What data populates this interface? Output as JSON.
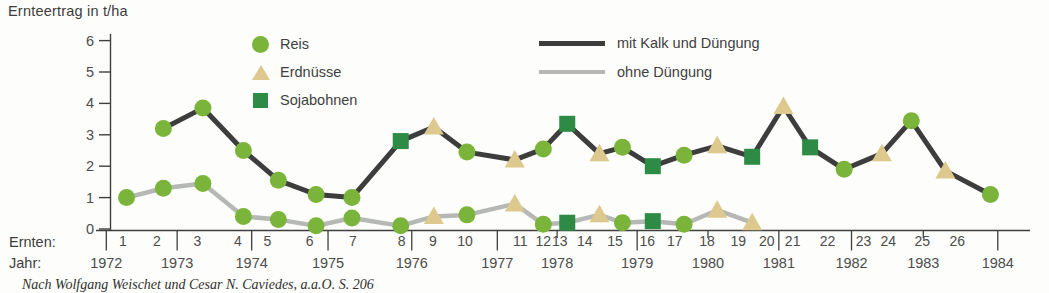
{
  "title": "Ernteertrag in t/ha",
  "legend": {
    "crops": [
      {
        "id": "reis",
        "label": "Reis",
        "shape": "circle",
        "color": "#7ab43a"
      },
      {
        "id": "erdnuesse",
        "label": "Erdnüsse",
        "shape": "triangle",
        "color": "#ddc88d"
      },
      {
        "id": "sojabohnen",
        "label": "Sojabohnen",
        "shape": "square",
        "color": "#2e8b46"
      }
    ],
    "lines": [
      {
        "id": "mit-kalk",
        "label": "mit Kalk und Düngung",
        "color": "#3d3d3d"
      },
      {
        "id": "ohne",
        "label": "ohne Düngung",
        "color": "#b6b8b5"
      }
    ]
  },
  "x_axis": {
    "ernten_caption": "Ernten:",
    "jahr_caption": "Jahr:"
  },
  "footnote": "Nach Wolfgang Weischet und Cesar N. Caviedes, a.a.O. S. 206",
  "chart_data": {
    "type": "line",
    "title": "Ernteertrag in t/ha",
    "ylabel": "Ernteertrag in t/ha",
    "ylim": [
      0,
      6
    ],
    "yticks": [
      0,
      1,
      2,
      3,
      4,
      5,
      6
    ],
    "grid": false,
    "legend_position": "top",
    "harvests": [
      {
        "n": 1,
        "label_x": 0.014,
        "marker_x": 0.018
      },
      {
        "n": 2,
        "label_x": 0.051,
        "marker_x": 0.058
      },
      {
        "n": 3,
        "label_x": 0.095,
        "marker_x": 0.101
      },
      {
        "n": 4,
        "label_x": 0.139,
        "marker_x": 0.145
      },
      {
        "n": 5,
        "label_x": 0.171,
        "marker_x": 0.183
      },
      {
        "n": 6,
        "label_x": 0.217,
        "marker_x": 0.224
      },
      {
        "n": 7,
        "label_x": 0.264,
        "marker_x": 0.263
      },
      {
        "n": 8,
        "label_x": 0.317,
        "marker_x": 0.316
      },
      {
        "n": 9,
        "label_x": 0.351,
        "marker_x": 0.352
      },
      {
        "n": 10,
        "label_x": 0.386,
        "marker_x": 0.388
      },
      {
        "n": 11,
        "label_x": 0.446,
        "marker_x": 0.44
      },
      {
        "n": 12,
        "label_x": 0.471,
        "marker_x": 0.471
      },
      {
        "n": 13,
        "label_x": 0.489,
        "marker_x": 0.497
      },
      {
        "n": 14,
        "label_x": 0.516,
        "marker_x": 0.532
      },
      {
        "n": 15,
        "label_x": 0.549,
        "marker_x": 0.557
      },
      {
        "n": 16,
        "label_x": 0.584,
        "marker_x": 0.59
      },
      {
        "n": 17,
        "label_x": 0.614,
        "marker_x": 0.624
      },
      {
        "n": 18,
        "label_x": 0.649,
        "marker_x": 0.66
      },
      {
        "n": 19,
        "label_x": 0.683,
        "marker_x": 0.698
      },
      {
        "n": 20,
        "label_x": 0.714,
        "marker_x": 0.732
      },
      {
        "n": 21,
        "label_x": 0.742,
        "marker_x": 0.761
      },
      {
        "n": 22,
        "label_x": 0.78,
        "marker_x": 0.798
      },
      {
        "n": 23,
        "label_x": 0.819,
        "marker_x": 0.839
      },
      {
        "n": 24,
        "label_x": 0.846,
        "marker_x": 0.871
      },
      {
        "n": 25,
        "label_x": 0.883,
        "marker_x": 0.908
      },
      {
        "n": 26,
        "label_x": 0.921,
        "marker_x": 0.957
      }
    ],
    "years": [
      {
        "year": 1972,
        "x": -0.004,
        "tick": "long"
      },
      {
        "year": 1973,
        "x": 0.073,
        "tick": "long"
      },
      {
        "year": 1974,
        "x": 0.154,
        "tick": "long"
      },
      {
        "year": 1975,
        "x": 0.237,
        "tick": "long"
      },
      {
        "year": 1976,
        "x": 0.328,
        "tick": "long"
      },
      {
        "year": 1977,
        "x": 0.421,
        "tick": "long"
      },
      {
        "year": 1978,
        "x": 0.486,
        "tick": "short"
      },
      {
        "year": 1979,
        "x": 0.573,
        "tick": "long"
      },
      {
        "year": 1980,
        "x": 0.65,
        "tick": "short"
      },
      {
        "year": 1981,
        "x": 0.727,
        "tick": "long"
      },
      {
        "year": 1982,
        "x": 0.806,
        "tick": "long"
      },
      {
        "year": 1983,
        "x": 0.884,
        "tick": "short"
      },
      {
        "year": 1984,
        "x": 0.965,
        "tick": "long"
      }
    ],
    "series": [
      {
        "name": "mit Kalk und Düngung",
        "color": "#3d3d3d",
        "width": 5,
        "points": [
          {
            "ernte": 2,
            "value": 3.2,
            "crop": "reis"
          },
          {
            "ernte": 3,
            "value": 3.85,
            "crop": "reis"
          },
          {
            "ernte": 4,
            "value": 2.5,
            "crop": "reis"
          },
          {
            "ernte": 5,
            "value": 1.55,
            "crop": "reis"
          },
          {
            "ernte": 6,
            "value": 1.1,
            "crop": "reis"
          },
          {
            "ernte": 7,
            "value": 1.0,
            "crop": "reis"
          },
          {
            "ernte": 8,
            "value": 2.8,
            "crop": "sojabohnen"
          },
          {
            "ernte": 9,
            "value": 3.25,
            "crop": "erdnuesse"
          },
          {
            "ernte": 10,
            "value": 2.45,
            "crop": "reis"
          },
          {
            "ernte": 11,
            "value": 2.2,
            "crop": "erdnuesse"
          },
          {
            "ernte": 12,
            "value": 2.55,
            "crop": "reis"
          },
          {
            "ernte": 13,
            "value": 3.35,
            "crop": "sojabohnen"
          },
          {
            "ernte": 14,
            "value": 2.4,
            "crop": "erdnuesse"
          },
          {
            "ernte": 15,
            "value": 2.6,
            "crop": "reis"
          },
          {
            "ernte": 16,
            "value": 2.0,
            "crop": "sojabohnen"
          },
          {
            "ernte": 17,
            "value": 2.35,
            "crop": "reis"
          },
          {
            "ernte": 18,
            "value": 2.65,
            "crop": "erdnuesse"
          },
          {
            "ernte": 19,
            "value": 2.3,
            "crop": "sojabohnen"
          },
          {
            "ernte": 20,
            "value": 3.9,
            "crop": "erdnuesse"
          },
          {
            "ernte": 21,
            "value": 2.6,
            "crop": "sojabohnen"
          },
          {
            "ernte": 22,
            "value": 1.9,
            "crop": "reis"
          },
          {
            "ernte": 23,
            "value": 2.4,
            "crop": "erdnuesse"
          },
          {
            "ernte": 24,
            "value": 3.45,
            "crop": "reis"
          },
          {
            "ernte": 25,
            "value": 1.85,
            "crop": "erdnuesse"
          },
          {
            "ernte": 26,
            "value": 1.1,
            "crop": "reis"
          }
        ]
      },
      {
        "name": "ohne Düngung",
        "color": "#b6b8b5",
        "width": 4.5,
        "points": [
          {
            "ernte": 1,
            "value": 1.0,
            "crop": "reis"
          },
          {
            "ernte": 2,
            "value": 1.3,
            "crop": "reis"
          },
          {
            "ernte": 3,
            "value": 1.45,
            "crop": "reis"
          },
          {
            "ernte": 4,
            "value": 0.4,
            "crop": "reis"
          },
          {
            "ernte": 5,
            "value": 0.3,
            "crop": "reis"
          },
          {
            "ernte": 6,
            "value": 0.1,
            "crop": "reis"
          },
          {
            "ernte": 7,
            "value": 0.35,
            "crop": "reis"
          },
          {
            "ernte": 8,
            "value": 0.1,
            "crop": "reis"
          },
          {
            "ernte": 9,
            "value": 0.4,
            "crop": "erdnuesse"
          },
          {
            "ernte": 10,
            "value": 0.45,
            "crop": "reis"
          },
          {
            "ernte": 11,
            "value": 0.8,
            "crop": "erdnuesse"
          },
          {
            "ernte": 12,
            "value": 0.15,
            "crop": "reis"
          },
          {
            "ernte": 13,
            "value": 0.2,
            "crop": "sojabohnen"
          },
          {
            "ernte": 14,
            "value": 0.45,
            "crop": "erdnuesse"
          },
          {
            "ernte": 15,
            "value": 0.2,
            "crop": "reis"
          },
          {
            "ernte": 16,
            "value": 0.25,
            "crop": "sojabohnen"
          },
          {
            "ernte": 17,
            "value": 0.15,
            "crop": "reis"
          },
          {
            "ernte": 18,
            "value": 0.6,
            "crop": "erdnuesse"
          },
          {
            "ernte": 19,
            "value": 0.2,
            "crop": "erdnuesse"
          }
        ]
      }
    ]
  }
}
